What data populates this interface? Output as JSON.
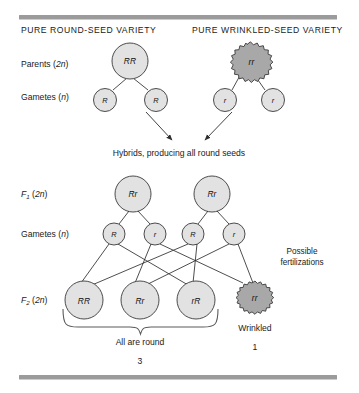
{
  "figure": {
    "title_left": "PURE ROUND-SEED VARIETY",
    "title_right": "PURE WRINKLED-SEED VARIETY",
    "hybrid_caption": "Hybrids, producing all round seeds",
    "fertilizations_caption_line1": "Possible",
    "fertilizations_caption_line2": "fertilizations",
    "round_caption": "All are round",
    "wrinkled_caption": "Wrinkled",
    "ratio_round": "3",
    "ratio_wrinkled": "1"
  },
  "row_labels": {
    "parents": {
      "text": "Parents (",
      "ploidy_italic": "2n",
      "close": ")"
    },
    "gametes_p": {
      "text": "Gametes (",
      "ploidy_italic": "n",
      "close": ")"
    },
    "f1": {
      "text": "F",
      "sub": "1",
      "paren_open": " (",
      "ploidy_italic": "2n",
      "close": ")"
    },
    "gametes_f1": {
      "text": "Gametes (",
      "ploidy_italic": "n",
      "close": ")"
    },
    "f2": {
      "text": "F",
      "sub": "2",
      "paren_open": " (",
      "ploidy_italic": "2n",
      "close": ")"
    }
  },
  "genotypes": {
    "parent_round": "RR",
    "parent_wrinkled": "rr",
    "gamete_p_round_1": "R",
    "gamete_p_round_2": "R",
    "gamete_p_wrinkled_1": "r",
    "gamete_p_wrinkled_2": "r",
    "f1_left": "Rr",
    "f1_right": "Rr",
    "gamete_f1_1": "R",
    "gamete_f1_2": "r",
    "gamete_f1_3": "R",
    "gamete_f1_4": "r",
    "f2_1": "RR",
    "f2_2": "Rr",
    "f2_3": "rR",
    "f2_4": "rr"
  },
  "colors": {
    "bar": "#9b9b9b",
    "round_fill": "#e2e2e2",
    "wrinkled_fill": "#a8a8a8",
    "outline": "#3a3a3a",
    "text": "#1a1a1a"
  }
}
